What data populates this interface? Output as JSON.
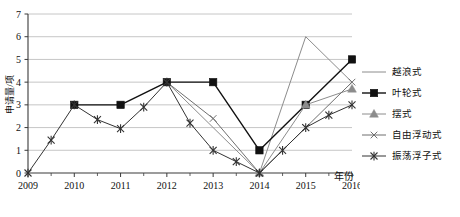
{
  "chart_data": {
    "type": "line",
    "title": "",
    "xlabel": "年份",
    "ylabel": "申请量/项",
    "xlim": [
      2009,
      2016
    ],
    "ylim": [
      0,
      7
    ],
    "grid": true,
    "legend_position": "right",
    "x_ticks": [
      "2009",
      "2010",
      "2011",
      "2012",
      "2013",
      "2014",
      "2015",
      "2016"
    ],
    "y_ticks": [
      "0",
      "1",
      "2",
      "3",
      "4",
      "5",
      "6",
      "7"
    ],
    "x": [
      2009,
      2010,
      2011,
      2012,
      2013,
      2014,
      2015,
      2016
    ],
    "series": [
      {
        "name": "越浪式",
        "marker": "none",
        "color": "#8c8c8c",
        "x": [
          2012,
          2013,
          2014,
          2015,
          2016
        ],
        "values": [
          4,
          2,
          0,
          6,
          4
        ]
      },
      {
        "name": "叶轮式",
        "marker": "square",
        "color": "#111111",
        "x": [
          2010,
          2011,
          2012,
          2013,
          2014,
          2015,
          2016
        ],
        "values": [
          3,
          3,
          4,
          4,
          1,
          3,
          5
        ]
      },
      {
        "name": "摆式",
        "marker": "triangle",
        "color": "#8c8c8c",
        "x": [
          2014,
          2015,
          2016
        ],
        "values": [
          0,
          3,
          3.7
        ]
      },
      {
        "name": "自由浮动式",
        "marker": "x",
        "color": "#6f6f6f",
        "x": [
          2012,
          2013,
          2014,
          2015,
          2016
        ],
        "values": [
          4,
          2.4,
          0,
          2,
          4
        ]
      },
      {
        "name": "振荡浮子式",
        "marker": "star",
        "color": "#333333",
        "x": [
          2009,
          2009.5,
          2010,
          2010.5,
          2011,
          2011.5,
          2012,
          2012.5,
          2013,
          2013.5,
          2014,
          2014.5,
          2015,
          2015.5,
          2016
        ],
        "values": [
          0,
          1.45,
          3,
          2.35,
          1.95,
          2.9,
          4,
          2.2,
          1,
          0.5,
          0,
          1,
          2,
          2.55,
          3
        ]
      }
    ]
  },
  "legend": {
    "items": [
      {
        "label": "越浪式",
        "marker": "none"
      },
      {
        "label": "叶轮式",
        "marker": "square"
      },
      {
        "label": "摆式",
        "marker": "triangle"
      },
      {
        "label": "自由浮动式",
        "marker": "x"
      },
      {
        "label": "振荡浮子式",
        "marker": "star"
      }
    ]
  }
}
